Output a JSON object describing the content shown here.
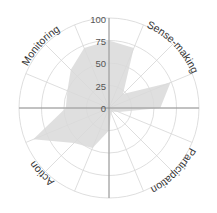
{
  "chart_data": {
    "type": "radar",
    "title": "",
    "center": [
      109,
      108
    ],
    "radius_px": 90,
    "rlim": [
      0,
      100
    ],
    "rticks": [
      0,
      25,
      50,
      75,
      100
    ],
    "grid": true,
    "n_spokes": 16,
    "angle_labels": [
      {
        "label": "Sense-making",
        "angle_deg": 45
      },
      {
        "label": "Participation",
        "angle_deg": 135
      },
      {
        "label": "Action",
        "angle_deg": 225
      },
      {
        "label": "Monitoring",
        "angle_deg": 315
      }
    ],
    "series": [
      {
        "name": "profile",
        "color": "#d9d9d9",
        "angles_deg": [
          0,
          22.5,
          45,
          67.5,
          90,
          112.5,
          135,
          157.5,
          180,
          202.5,
          225,
          247.5,
          270,
          292.5,
          315,
          337.5
        ],
        "values": [
          75,
          72,
          22,
          74,
          57,
          12,
          6,
          6,
          25,
          48,
          55,
          91,
          48,
          50,
          60,
          72
        ]
      }
    ]
  },
  "tick_labels": [
    "0",
    "25",
    "50",
    "75",
    "100"
  ],
  "quadrant_labels": {
    "top_right": "Sense-making",
    "bottom_right": "Participation",
    "bottom_left": "Action",
    "top_left": "Monitoring"
  }
}
